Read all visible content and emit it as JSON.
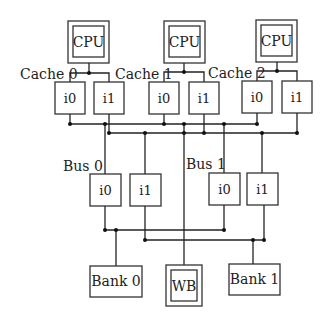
{
  "diagram": {
    "cpus": [
      {
        "label": "CPU"
      },
      {
        "label": "CPU"
      },
      {
        "label": "CPU"
      }
    ],
    "caches": [
      {
        "label": "Cache 0",
        "ports": [
          "i0",
          "i1"
        ]
      },
      {
        "label": "Cache 1",
        "ports": [
          "i0",
          "i1"
        ]
      },
      {
        "label": "Cache 2",
        "ports": [
          "i0",
          "i1"
        ]
      }
    ],
    "buses": [
      {
        "label": "Bus 0",
        "ports": [
          "i0",
          "i1"
        ]
      },
      {
        "label": "Bus 1",
        "ports": [
          "i0",
          "i1"
        ]
      }
    ],
    "memory": [
      {
        "label": "Bank 0"
      },
      {
        "label": "WB"
      },
      {
        "label": "Bank 1"
      }
    ],
    "colors": {
      "line": "#222222",
      "background": "#ffffff"
    }
  }
}
